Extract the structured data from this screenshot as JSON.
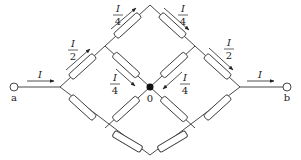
{
  "diagram": {
    "type": "resistor-network",
    "colors": {
      "stroke": "#333333",
      "resistor_fill": "#ffffff",
      "node_fill": "#111111",
      "background": "#ffffff"
    },
    "terminals": {
      "a": "a",
      "b": "b",
      "center": "0"
    },
    "current_labels": {
      "input": "I",
      "output": "I",
      "upper_left_half": {
        "num": "I",
        "den": "2"
      },
      "upper_left_quarter": {
        "num": "I",
        "den": "4"
      },
      "upper_right_quarter": {
        "num": "I",
        "den": "4"
      },
      "upper_right_half": {
        "num": "I",
        "den": "2"
      },
      "center_left_quarter": {
        "num": "I",
        "den": "4"
      },
      "center_right_quarter": {
        "num": "I",
        "den": "4"
      }
    },
    "resistor_count": 12
  }
}
